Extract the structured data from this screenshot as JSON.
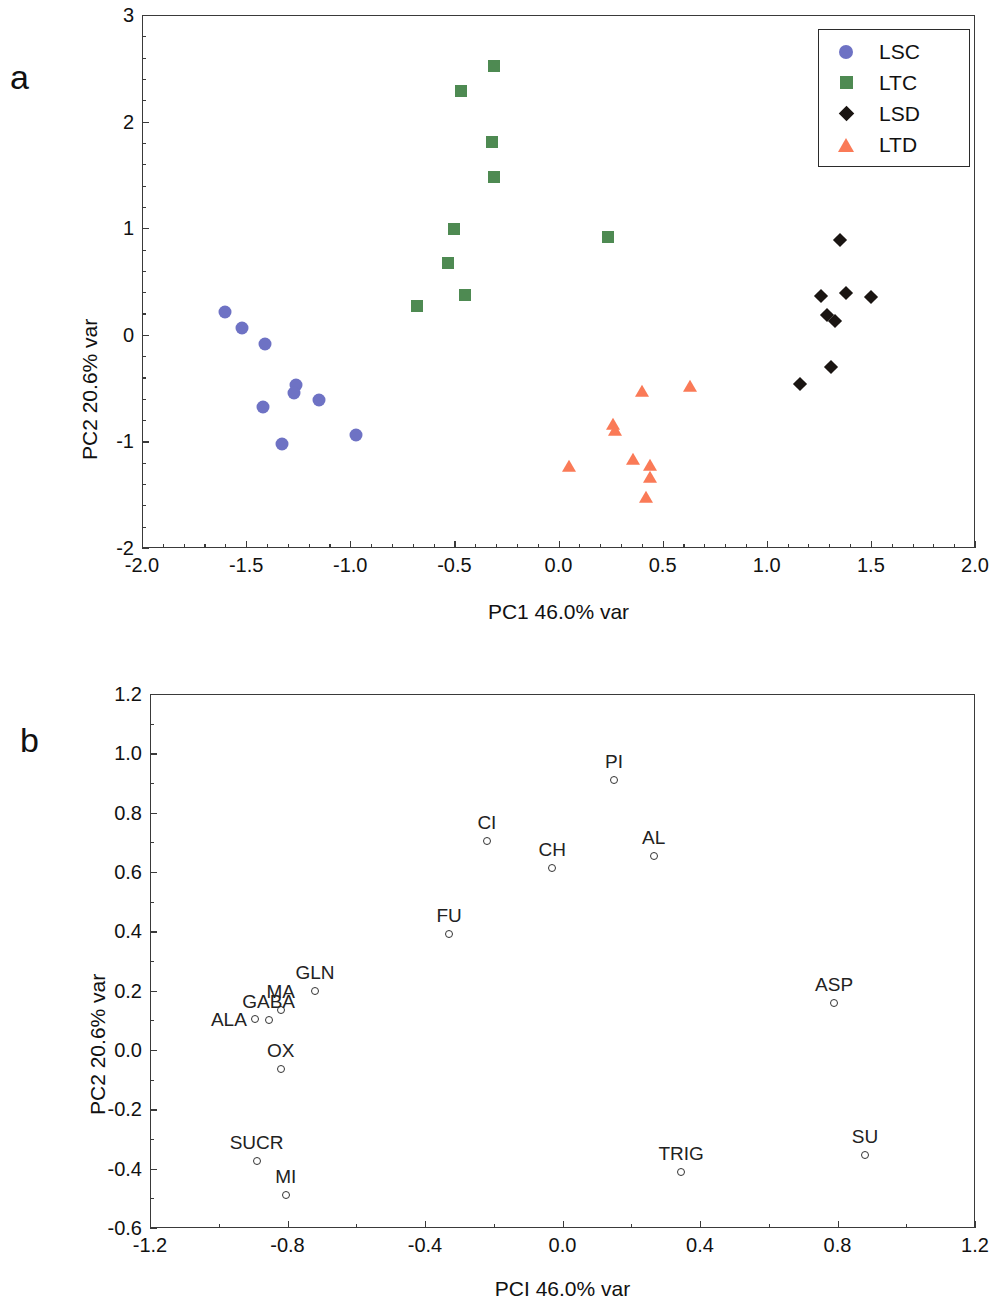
{
  "figure": {
    "panel_a_letter": "a",
    "panel_b_letter": "b"
  },
  "colors": {
    "lsc": "#6e72c4",
    "ltc": "#4e8a52",
    "lsd": "#1a1512",
    "ltd": "#fa7a57",
    "axis": "#3a3a3a",
    "text": "#111111"
  },
  "chart_data": [
    {
      "type": "scatter",
      "panel": "a",
      "title": "",
      "xlabel": "PC1 46.0% var",
      "ylabel": "PC2 20.6% var",
      "xlim": [
        -2.0,
        2.0
      ],
      "ylim": [
        -2,
        3
      ],
      "xticks": [
        "-2.0",
        "-1.5",
        "-1.0",
        "-0.5",
        "0.0",
        "0.5",
        "1.0",
        "1.5",
        "2.0"
      ],
      "xtick_values": [
        -2.0,
        -1.5,
        -1.0,
        -0.5,
        0.0,
        0.5,
        1.0,
        1.5,
        2.0
      ],
      "yticks": [
        "-2",
        "-1",
        "0",
        "1",
        "2",
        "3"
      ],
      "ytick_values": [
        -2,
        -1,
        0,
        1,
        2,
        3
      ],
      "grid": false,
      "legend_position": "upper right",
      "series": [
        {
          "name": "LSC",
          "marker": "circle",
          "color": "#6e72c4",
          "points": [
            [
              -1.6,
              0.21
            ],
            [
              -1.52,
              0.06
            ],
            [
              -1.41,
              -0.09
            ],
            [
              -1.26,
              -0.47
            ],
            [
              -1.27,
              -0.55
            ],
            [
              -1.42,
              -0.68
            ],
            [
              -1.15,
              -0.61
            ],
            [
              -1.33,
              -1.02
            ],
            [
              -0.97,
              -0.94
            ]
          ]
        },
        {
          "name": "LTC",
          "marker": "square",
          "color": "#4e8a52",
          "points": [
            [
              -0.31,
              2.52
            ],
            [
              -0.47,
              2.29
            ],
            [
              -0.32,
              1.81
            ],
            [
              -0.31,
              1.48
            ],
            [
              -0.5,
              0.99
            ],
            [
              -0.53,
              0.67
            ],
            [
              -0.45,
              0.37
            ],
            [
              -0.68,
              0.27
            ],
            [
              0.24,
              0.92
            ]
          ]
        },
        {
          "name": "LSD",
          "marker": "diamond",
          "color": "#1a1512",
          "points": [
            [
              1.35,
              0.89
            ],
            [
              1.26,
              0.36
            ],
            [
              1.38,
              0.39
            ],
            [
              1.5,
              0.35
            ],
            [
              1.29,
              0.19
            ],
            [
              1.33,
              0.13
            ],
            [
              1.31,
              -0.3
            ],
            [
              1.16,
              -0.46
            ]
          ]
        },
        {
          "name": "LTD",
          "marker": "triangle",
          "color": "#fa7a57",
          "points": [
            [
              0.4,
              -0.54
            ],
            [
              0.63,
              -0.49
            ],
            [
              0.26,
              -0.85
            ],
            [
              0.27,
              -0.9
            ],
            [
              0.05,
              -1.24
            ],
            [
              0.36,
              -1.17
            ],
            [
              0.44,
              -1.23
            ],
            [
              0.44,
              -1.34
            ],
            [
              0.42,
              -1.53
            ]
          ]
        }
      ]
    },
    {
      "type": "scatter",
      "panel": "b",
      "title": "",
      "xlabel": "PCI 46.0% var",
      "ylabel": "PC2 20.6% var",
      "xlim": [
        -1.2,
        1.2
      ],
      "ylim": [
        -0.6,
        1.2
      ],
      "xticks": [
        "-1.2",
        "-0.8",
        "-0.4",
        "0.0",
        "0.4",
        "0.8",
        "1.2"
      ],
      "xtick_values": [
        -1.2,
        -0.8,
        -0.4,
        0.0,
        0.4,
        0.8,
        1.2
      ],
      "yticks": [
        "-0.6",
        "-0.4",
        "-0.2",
        "0.0",
        "0.2",
        "0.4",
        "0.6",
        "0.8",
        "1.0",
        "1.2"
      ],
      "ytick_values": [
        -0.6,
        -0.4,
        -0.2,
        0.0,
        0.2,
        0.4,
        0.6,
        0.8,
        1.0,
        1.2
      ],
      "grid": false,
      "marker": "open-circle",
      "points": [
        {
          "label": "PI",
          "x": 0.15,
          "y": 0.91,
          "label_pos": "above"
        },
        {
          "label": "CI",
          "x": -0.22,
          "y": 0.705,
          "label_pos": "above"
        },
        {
          "label": "CH",
          "x": -0.03,
          "y": 0.615,
          "label_pos": "above"
        },
        {
          "label": "AL",
          "x": 0.265,
          "y": 0.655,
          "label_pos": "above"
        },
        {
          "label": "FU",
          "x": -0.33,
          "y": 0.39,
          "label_pos": "above"
        },
        {
          "label": "GLN",
          "x": -0.72,
          "y": 0.2,
          "label_pos": "above"
        },
        {
          "label": "MA",
          "x": -0.82,
          "y": 0.135,
          "label_pos": "above"
        },
        {
          "label": "GABA",
          "x": -0.855,
          "y": 0.1,
          "label_pos": "above"
        },
        {
          "label": "ALA",
          "x": -0.895,
          "y": 0.105,
          "label_pos": "left"
        },
        {
          "label": "OX",
          "x": -0.82,
          "y": -0.065,
          "label_pos": "above"
        },
        {
          "label": "ASP",
          "x": 0.79,
          "y": 0.16,
          "label_pos": "above"
        },
        {
          "label": "SUCR",
          "x": -0.89,
          "y": -0.375,
          "label_pos": "above"
        },
        {
          "label": "MI",
          "x": -0.805,
          "y": -0.49,
          "label_pos": "above"
        },
        {
          "label": "TRIG",
          "x": 0.345,
          "y": -0.41,
          "label_pos": "above"
        },
        {
          "label": "SU",
          "x": 0.88,
          "y": -0.355,
          "label_pos": "above"
        }
      ]
    }
  ]
}
